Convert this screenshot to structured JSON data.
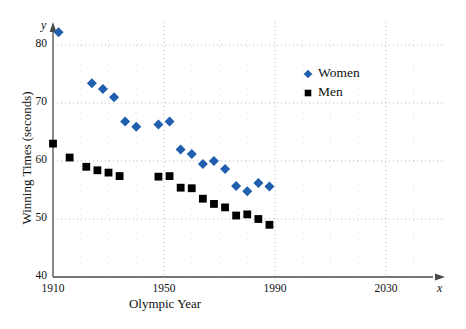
{
  "chart_data": {
    "type": "scatter",
    "title": "",
    "xlabel": "Olympic Year",
    "ylabel": "Winning Times (seconds)",
    "x_axis_symbol": "x",
    "y_axis_symbol": "y",
    "xlim": [
      1910,
      2045
    ],
    "ylim": [
      40,
      85
    ],
    "xticks": [
      "1910",
      "1950",
      "1990",
      "2030"
    ],
    "xtick_values": [
      1910,
      1950,
      1990,
      2030
    ],
    "yticks": [
      "40",
      "50",
      "60",
      "70",
      "80"
    ],
    "ytick_values": [
      40,
      50,
      60,
      70,
      80
    ],
    "grid": true,
    "grid_style": "dotted",
    "legend_position": "upper-right",
    "series": [
      {
        "name": "Women",
        "marker": "diamond",
        "color": "#1f5fad",
        "points": [
          [
            1912,
            82.2
          ],
          [
            1924,
            73.4
          ],
          [
            1928,
            72.4
          ],
          [
            1932,
            71.0
          ],
          [
            1936,
            66.8
          ],
          [
            1940,
            65.9
          ],
          [
            1948,
            66.3
          ],
          [
            1952,
            66.8
          ],
          [
            1956,
            62.0
          ],
          [
            1960,
            61.2
          ],
          [
            1964,
            59.5
          ],
          [
            1968,
            60.0
          ],
          [
            1972,
            58.6
          ],
          [
            1976,
            55.7
          ],
          [
            1980,
            54.8
          ],
          [
            1984,
            56.2
          ],
          [
            1988,
            55.6
          ]
        ]
      },
      {
        "name": "Men",
        "marker": "square",
        "color": "#000000",
        "points": [
          [
            1910,
            63.0
          ],
          [
            1916,
            60.6
          ],
          [
            1922,
            59.0
          ],
          [
            1926,
            58.4
          ],
          [
            1930,
            58.0
          ],
          [
            1934,
            57.4
          ],
          [
            1948,
            57.3
          ],
          [
            1952,
            57.4
          ],
          [
            1956,
            55.4
          ],
          [
            1960,
            55.3
          ],
          [
            1964,
            53.5
          ],
          [
            1968,
            52.6
          ],
          [
            1972,
            52.0
          ],
          [
            1976,
            50.6
          ],
          [
            1980,
            50.8
          ],
          [
            1984,
            50.0
          ],
          [
            1988,
            49.0
          ]
        ]
      }
    ]
  },
  "legend": {
    "items": [
      {
        "label": "Women",
        "marker": "diamond",
        "color": "#1f5fad"
      },
      {
        "label": "Men",
        "marker": "square",
        "color": "#000000"
      }
    ]
  }
}
